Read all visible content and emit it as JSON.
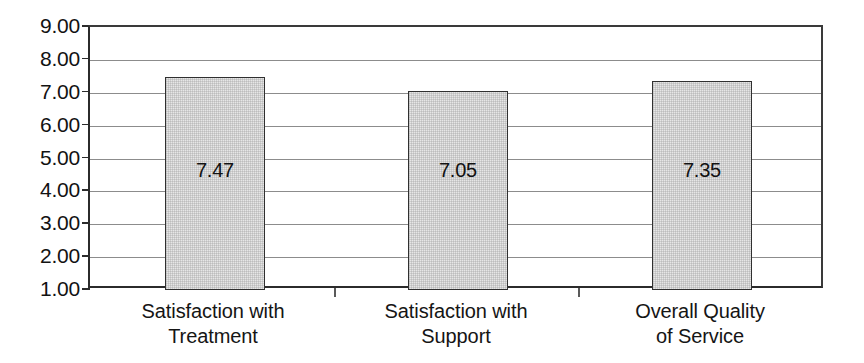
{
  "chart_data": {
    "type": "bar",
    "title": "",
    "subtitle": "",
    "xlabel": "",
    "ylabel": "",
    "categories": [
      "Satisfaction with Treatment",
      "Satisfaction with Support",
      "Overall Quality of Service"
    ],
    "category_lines": [
      [
        "Satisfaction with",
        "Treatment"
      ],
      [
        "Satisfaction with",
        "Support"
      ],
      [
        "Overall Quality",
        "of Service"
      ]
    ],
    "values": [
      7.47,
      7.05,
      7.35
    ],
    "value_labels": [
      "7.47",
      "7.05",
      "7.35"
    ],
    "ylim": [
      1.0,
      9.0
    ],
    "ytick_step": 1.0,
    "ytick_labels": [
      "9.00",
      "8.00",
      "7.00",
      "6.00",
      "5.00",
      "4.00",
      "3.00",
      "2.00",
      "1.00"
    ],
    "ytick_values": [
      9.0,
      8.0,
      7.0,
      6.0,
      5.0,
      4.0,
      3.0,
      2.0,
      1.0
    ],
    "grid": true,
    "grid_axis": "y",
    "legend": false,
    "legend_position": "none",
    "series": [
      {
        "name": "",
        "values": [
          7.47,
          7.05,
          7.35
        ]
      }
    ],
    "colors": {
      "bar_fill": "#e6e6e6",
      "bar_border": "#303030",
      "gridline": "#8c8c8c",
      "axis": "#2b2b2b",
      "text": "#121212",
      "background": "#ffffff"
    }
  }
}
